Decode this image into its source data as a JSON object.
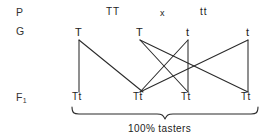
{
  "diagram": {
    "title_rows": [
      {
        "key": "P",
        "label": "P"
      },
      {
        "key": "G",
        "label": "G"
      },
      {
        "key": "F1",
        "label": "F",
        "sub": "1"
      }
    ],
    "parental": {
      "left_genotype": "TT",
      "cross_symbol": "x",
      "right_genotype": "tt"
    },
    "gametes": [
      {
        "id": "g1",
        "label": "T",
        "x": 79,
        "y": 33
      },
      {
        "id": "g2",
        "label": "T",
        "x": 140,
        "y": 33
      },
      {
        "id": "g3",
        "label": "t",
        "x": 188,
        "y": 33
      },
      {
        "id": "g4",
        "label": "t",
        "x": 248,
        "y": 33
      }
    ],
    "offspring": [
      {
        "id": "f1a",
        "label": "Tt",
        "x": 79,
        "y": 97
      },
      {
        "id": "f1b",
        "label": "Tt",
        "x": 140,
        "y": 97
      },
      {
        "id": "f1c",
        "label": "Tt",
        "x": 188,
        "y": 97
      },
      {
        "id": "f1d",
        "label": "Tt",
        "x": 248,
        "y": 97
      }
    ],
    "caption": "100% tasters",
    "colors": {
      "ink": "#2a2a2a",
      "text": "#222222",
      "background": "#ffffff"
    }
  }
}
